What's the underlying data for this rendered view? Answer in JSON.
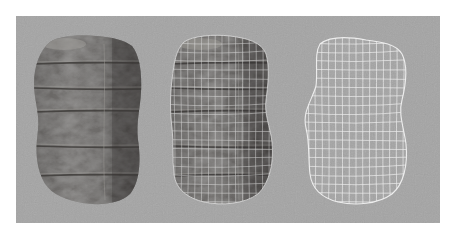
{
  "figure": {
    "backdrop_color": "#a4a4a4",
    "page_color": "#ffffff",
    "panels": [
      {
        "id": "textured",
        "label": "Textured rock",
        "texture_color": "#6e6c6a",
        "shadow_color": "#3e3c3a",
        "highlight_color": "#a09e9a",
        "wireframe": false
      },
      {
        "id": "textured-wireframe",
        "label": "Textured rock with wireframe overlay",
        "texture_color": "#6a6866",
        "shadow_color": "#3c3a38",
        "highlight_color": "#9c9a96",
        "wireframe": true,
        "wire_color": "#e8e8e8"
      },
      {
        "id": "wireframe",
        "label": "Wireframe only",
        "wireframe": true,
        "wire_color": "#f4f4f4"
      }
    ]
  }
}
